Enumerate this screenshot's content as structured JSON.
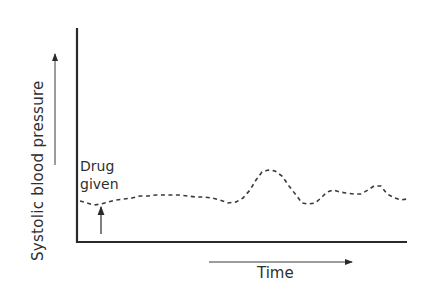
{
  "chart_data": {
    "type": "line",
    "title": "",
    "xlabel": "Time",
    "ylabel": "Systolic blood pressure",
    "style": "dashed schematic trace, no tick marks or numeric axes",
    "grid": false,
    "legend": null,
    "annotations": [
      {
        "text": "Drug given",
        "x": 101,
        "y": 204,
        "arrow": "up"
      }
    ],
    "units": "pixel coordinates (schematic, no numeric scale)",
    "axis_origin": [
      77,
      242
    ],
    "x": [
      80,
      87,
      94,
      101,
      108,
      116,
      124,
      132,
      140,
      148,
      156,
      164,
      172,
      180,
      188,
      196,
      204,
      212,
      220,
      228,
      236,
      243,
      250,
      256,
      262,
      268,
      275,
      282,
      289,
      296,
      302,
      308,
      315,
      321,
      327,
      333,
      340,
      346,
      354,
      361,
      368,
      374,
      381,
      387,
      395,
      401,
      407
    ],
    "values": [
      201,
      203,
      205,
      204,
      202,
      200,
      199,
      198,
      196,
      196,
      195,
      195,
      195,
      195,
      196,
      197,
      197,
      198,
      200,
      203,
      202,
      198,
      190,
      180,
      172,
      170,
      171,
      176,
      186,
      195,
      203,
      204,
      203,
      198,
      192,
      190,
      192,
      193,
      194,
      194,
      190,
      186,
      186,
      194,
      198,
      200,
      199
    ]
  },
  "labels": {
    "ylabel": "Systolic blood pressure",
    "xlabel": "Time",
    "annotation": "Drug given"
  }
}
